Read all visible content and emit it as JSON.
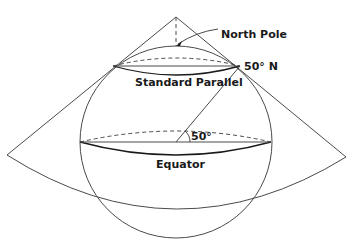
{
  "diagram": {
    "type": "conic-projection",
    "labels": {
      "north_pole": "North Pole",
      "latitude": "50° N",
      "standard_parallel": "Standard Parallel",
      "angle": "50°",
      "equator": "Equator"
    },
    "colors": {
      "line": "#4a4a4a",
      "text": "#1a1a1a",
      "background": "#ffffff"
    }
  }
}
